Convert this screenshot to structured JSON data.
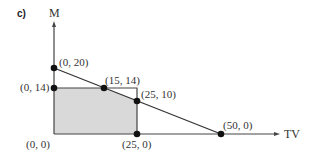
{
  "part_label": "c)",
  "axes": {
    "x_label": "TV",
    "y_label": "M"
  },
  "colors": {
    "region_fill": "#d9d9d9",
    "line": "#333333",
    "point": "#111111"
  },
  "points": [
    {
      "label": "(0, 20)",
      "x": 0,
      "y": 20
    },
    {
      "label": "(0, 14)",
      "x": 0,
      "y": 14
    },
    {
      "label": "(15, 14)",
      "x": 15,
      "y": 14
    },
    {
      "label": "(25, 10)",
      "x": 25,
      "y": 10
    },
    {
      "label": "(0, 0)",
      "x": 0,
      "y": 0
    },
    {
      "label": "(25, 0)",
      "x": 25,
      "y": 0
    },
    {
      "label": "(50, 0)",
      "x": 50,
      "y": 0
    }
  ],
  "constraints": [
    {
      "name": "budget-line",
      "from": "(0, 20)",
      "to": "(50, 0)"
    },
    {
      "name": "m-limit",
      "value": "M = 14"
    },
    {
      "name": "tv-limit",
      "value": "TV = 25"
    }
  ],
  "feasible_region": [
    "(0, 0)",
    "(0, 14)",
    "(15, 14)",
    "(25, 10)",
    "(25, 0)"
  ]
}
